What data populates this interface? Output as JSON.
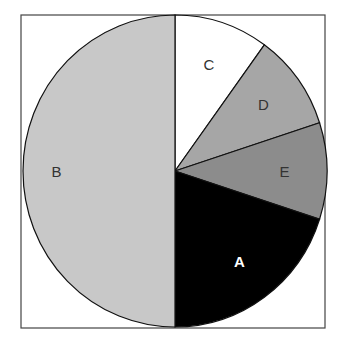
{
  "chart_data": {
    "type": "pie",
    "title": "",
    "start_angle_deg": 0,
    "direction": "clockwise",
    "slices": [
      {
        "label": "C",
        "value": 10,
        "color": "#ffffff",
        "label_color": "#333333",
        "bold": false
      },
      {
        "label": "D",
        "value": 10,
        "color": "#a6a6a6",
        "label_color": "#333333",
        "bold": false
      },
      {
        "label": "E",
        "value": 10,
        "color": "#8c8c8c",
        "label_color": "#333333",
        "bold": false
      },
      {
        "label": "A",
        "value": 20,
        "color": "#000000",
        "label_color": "#ffffff",
        "bold": true
      },
      {
        "label": "B",
        "value": 50,
        "color": "#c8c8c8",
        "label_color": "#333333",
        "bold": false
      }
    ],
    "categories": [
      "C",
      "D",
      "E",
      "A",
      "B"
    ],
    "values": [
      10,
      10,
      10,
      20,
      50
    ],
    "legend": "none",
    "units": "percent"
  },
  "frame": {
    "x": 21,
    "y": 15,
    "width": 304,
    "height": 313
  },
  "pie": {
    "cx": 175,
    "cy": 171,
    "rx": 152,
    "ry": 156
  }
}
